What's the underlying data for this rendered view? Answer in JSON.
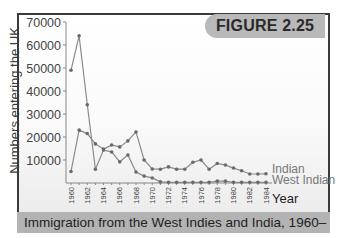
{
  "figure": {
    "badge": "FIGURE 2.25",
    "caption": "Immigration from the West Indies and India, 1960–1984"
  },
  "colors": {
    "frame_border": "#3a3a3a",
    "badge_bg": "#b9b9b9",
    "caption_bg": "#b3b3b3",
    "line": "#8a8a8a",
    "marker": "#6a6a6a"
  },
  "chart_data": {
    "type": "line",
    "title": "Immigration from the West Indies and India, 1960–1984",
    "xlabel": "Year",
    "ylabel": "Numbers entering the UK",
    "ylim": [
      0,
      70000
    ],
    "yticks": [
      10000,
      20000,
      30000,
      40000,
      50000,
      60000,
      70000
    ],
    "ytick_labels": [
      "10000",
      "20000",
      "30000",
      "40000",
      "50000",
      "60000",
      "70000"
    ],
    "x": [
      1960,
      1961,
      1962,
      1963,
      1964,
      1965,
      1966,
      1967,
      1968,
      1969,
      1970,
      1971,
      1972,
      1973,
      1974,
      1975,
      1976,
      1977,
      1978,
      1979,
      1980,
      1981,
      1982,
      1983,
      1984
    ],
    "xtick_labels": [
      "1960",
      "1962",
      "1964",
      "1966",
      "1968",
      "1970",
      "1972",
      "1974",
      "1976",
      "1978",
      "1980",
      "1982",
      "1984"
    ],
    "grid": false,
    "legend_position": "inline-right",
    "series": [
      {
        "name": "Indian",
        "values": [
          5000,
          23000,
          21500,
          17000,
          14800,
          16500,
          15700,
          18300,
          22200,
          10000,
          6100,
          6000,
          7000,
          6000,
          6000,
          9000,
          10000,
          6000,
          8500,
          7800,
          6500,
          5300,
          3900,
          3900,
          4000
        ]
      },
      {
        "name": "West Indian",
        "values": [
          49000,
          64000,
          34000,
          6000,
          14300,
          13500,
          9200,
          12200,
          4800,
          3000,
          2200,
          500,
          300,
          300,
          300,
          300,
          300,
          300,
          800,
          800,
          300,
          300,
          300,
          300,
          300
        ]
      }
    ]
  }
}
